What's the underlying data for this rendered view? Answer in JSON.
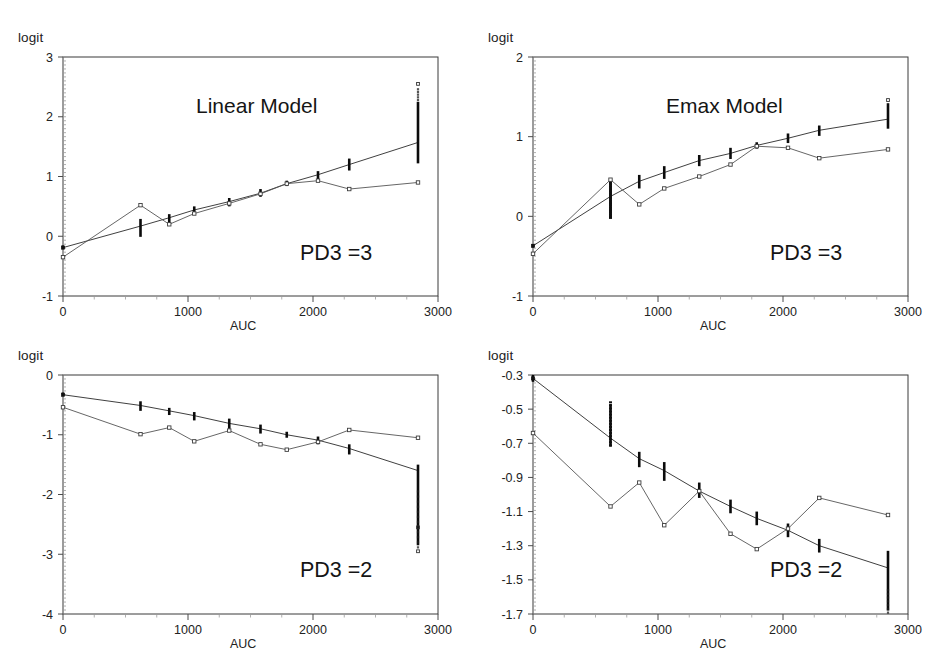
{
  "figure": {
    "panel_count": 4,
    "shared_xlabel": "AUC",
    "shared_ylabel": "logit",
    "xticks": [
      "0",
      "1000",
      "2000",
      "3000"
    ]
  },
  "panels": [
    {
      "id": "top-left",
      "model_title": "Linear Model",
      "group_label": "PD3 =3",
      "ylabel": "logit",
      "xlabel": "AUC",
      "yticks": [
        "3",
        "2",
        "1",
        "0",
        "-1"
      ]
    },
    {
      "id": "top-right",
      "model_title": "Emax Model",
      "group_label": "PD3 =3",
      "ylabel": "logit",
      "xlabel": "AUC",
      "yticks": [
        "2",
        "1",
        "0",
        "-1"
      ]
    },
    {
      "id": "bottom-left",
      "model_title": "",
      "group_label": "PD3 =2",
      "ylabel": "logit",
      "xlabel": "AUC",
      "yticks": [
        "0",
        "-1",
        "-2",
        "-3",
        "-4"
      ]
    },
    {
      "id": "bottom-right",
      "model_title": "",
      "group_label": "PD3 =2",
      "ylabel": "logit",
      "xlabel": "AUC",
      "yticks": [
        "-0.3",
        "-0.5",
        "-0.7",
        "-0.9",
        "-1.1",
        "-1.3",
        "-1.5",
        "-1.7"
      ]
    }
  ],
  "chart_data": [
    {
      "type": "scatter",
      "panel": "top-left",
      "title": "Linear Model",
      "annotation": "PD3 =3",
      "xlabel": "AUC",
      "ylabel": "logit",
      "xlim": [
        0,
        3000
      ],
      "ylim": [
        -1,
        3
      ],
      "ytick_step": 1,
      "xtick_step": 1000,
      "grid": false,
      "legend": "none",
      "x": [
        0,
        620,
        850,
        1050,
        1330,
        1580,
        1790,
        2040,
        2290,
        2840
      ],
      "series": [
        {
          "name": "predicted",
          "style": "line-with-vertical-scatter-clusters",
          "values": [
            -0.19,
            0.17,
            0.31,
            0.44,
            0.58,
            0.72,
            0.88,
            1.03,
            1.2,
            1.57
          ],
          "cluster_low": [
            -0.21,
            -0.01,
            0.21,
            0.37,
            0.5,
            0.66,
            0.84,
            0.95,
            1.1,
            1.22
          ],
          "cluster_high": [
            -0.17,
            0.29,
            0.37,
            0.5,
            0.64,
            0.79,
            0.93,
            1.09,
            1.3,
            2.25
          ],
          "outlier_points": [
            [
              2840,
              2.55
            ]
          ]
        },
        {
          "name": "observed",
          "style": "zigzag-line-with-open-markers",
          "values": [
            -0.35,
            0.52,
            0.2,
            0.38,
            0.55,
            0.71,
            0.88,
            0.93,
            0.79,
            0.9
          ]
        }
      ]
    },
    {
      "type": "scatter",
      "panel": "top-right",
      "title": "Emax Model",
      "annotation": "PD3 =3",
      "xlabel": "AUC",
      "ylabel": "logit",
      "xlim": [
        0,
        3000
      ],
      "ylim": [
        -1,
        2
      ],
      "ytick_step": 1,
      "xtick_step": 1000,
      "grid": false,
      "legend": "none",
      "x": [
        0,
        620,
        850,
        1050,
        1330,
        1580,
        1790,
        2040,
        2290,
        2840
      ],
      "series": [
        {
          "name": "predicted",
          "style": "line-with-vertical-scatter-clusters",
          "values": [
            -0.37,
            0.25,
            0.44,
            0.55,
            0.7,
            0.79,
            0.89,
            0.98,
            1.08,
            1.22
          ],
          "cluster_low": [
            -0.39,
            0.0,
            0.35,
            0.47,
            0.63,
            0.72,
            0.85,
            0.92,
            1.01,
            1.1
          ],
          "cluster_high": [
            -0.35,
            0.45,
            0.52,
            0.63,
            0.77,
            0.86,
            0.93,
            1.04,
            1.14,
            1.42
          ],
          "outlier_points": [
            [
              2840,
              1.46
            ]
          ]
        },
        {
          "name": "observed",
          "style": "zigzag-line-with-open-markers",
          "values": [
            -0.47,
            0.46,
            0.15,
            0.35,
            0.5,
            0.65,
            0.88,
            0.86,
            0.73,
            0.84
          ]
        }
      ]
    },
    {
      "type": "scatter",
      "panel": "bottom-left",
      "title": "",
      "annotation": "PD3 =2",
      "xlabel": "AUC",
      "ylabel": "logit",
      "xlim": [
        0,
        3000
      ],
      "ylim": [
        -4,
        0
      ],
      "ytick_step": 1,
      "xtick_step": 1000,
      "grid": false,
      "legend": "none",
      "x": [
        0,
        620,
        850,
        1050,
        1330,
        1580,
        1790,
        2040,
        2290,
        2840
      ],
      "series": [
        {
          "name": "predicted",
          "style": "line-with-vertical-scatter-clusters",
          "values": [
            -0.33,
            -0.51,
            -0.6,
            -0.68,
            -0.81,
            -0.9,
            -1.0,
            -1.09,
            -1.23,
            -1.6
          ],
          "cluster_low": [
            -0.35,
            -0.6,
            -0.67,
            -0.76,
            -0.9,
            -0.98,
            -1.05,
            -1.16,
            -1.33,
            -2.85
          ],
          "cluster_high": [
            -0.31,
            -0.44,
            -0.55,
            -0.62,
            -0.73,
            -0.83,
            -0.95,
            -1.03,
            -1.16,
            -1.5
          ],
          "outlier_points": [
            [
              2840,
              -2.55
            ],
            [
              2840,
              -2.95
            ]
          ]
        },
        {
          "name": "observed",
          "style": "zigzag-line-with-open-markers",
          "values": [
            -0.54,
            -0.99,
            -0.88,
            -1.11,
            -0.93,
            -1.16,
            -1.25,
            -1.12,
            -0.92,
            -1.05
          ]
        }
      ]
    },
    {
      "type": "scatter",
      "panel": "bottom-right",
      "title": "",
      "annotation": "PD3 =2",
      "xlabel": "AUC",
      "ylabel": "logit",
      "xlim": [
        -1.7,
        -0.3
      ],
      "ylim": [
        -1.7,
        -0.3
      ],
      "ytick_step": 0.2,
      "xtick_step": 1000,
      "grid": false,
      "legend": "none",
      "x": [
        0,
        620,
        850,
        1050,
        1330,
        1580,
        1790,
        2040,
        2290,
        2840
      ],
      "series": [
        {
          "name": "predicted",
          "style": "line-with-vertical-scatter-clusters",
          "values": [
            -0.32,
            -0.67,
            -0.79,
            -0.86,
            -0.98,
            -1.07,
            -1.14,
            -1.21,
            -1.3,
            -1.43
          ],
          "cluster_low": [
            -0.34,
            -0.72,
            -0.84,
            -0.92,
            -1.02,
            -1.11,
            -1.18,
            -1.25,
            -1.34,
            -1.68
          ],
          "cluster_high": [
            -0.3,
            -0.47,
            -0.75,
            -0.81,
            -0.93,
            -1.03,
            -1.1,
            -1.17,
            -1.26,
            -1.33
          ],
          "outlier_points": []
        },
        {
          "name": "observed",
          "style": "zigzag-line-with-open-markers",
          "values": [
            -0.64,
            -1.07,
            -0.93,
            -1.18,
            -0.98,
            -1.23,
            -1.32,
            -1.2,
            -1.02,
            -1.12
          ]
        }
      ]
    }
  ]
}
